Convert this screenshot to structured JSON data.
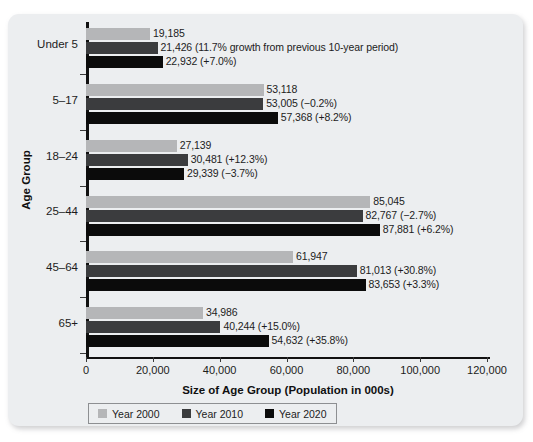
{
  "chart_data": {
    "type": "bar",
    "orientation": "horizontal",
    "title": "",
    "xlabel": "Size of Age Group (Population in 000s)",
    "ylabel": "Age Group",
    "xlim": [
      0,
      120000
    ],
    "xticks": [
      0,
      20000,
      40000,
      60000,
      80000,
      100000,
      120000
    ],
    "xtick_labels": [
      "0",
      "20,000",
      "40,000",
      "60,000",
      "80,000",
      "100,000",
      "120,000"
    ],
    "grid": false,
    "legend_position": "bottom",
    "categories": [
      "Under 5",
      "5–17",
      "18–24",
      "25–44",
      "45–64",
      "65+"
    ],
    "series": [
      {
        "name": "Year 2000",
        "color": "#b5b6b8",
        "values": [
          19185,
          53118,
          27139,
          85045,
          61947,
          34986
        ],
        "labels": [
          "19,185",
          "53,118",
          "27,139",
          "85,045",
          "61,947",
          "34,986"
        ]
      },
      {
        "name": "Year 2010",
        "color": "#3b3c3e",
        "values": [
          21426,
          53005,
          30481,
          82767,
          81013,
          40244
        ],
        "labels": [
          "21,426 (11.7% growth from previous 10-year period)",
          "53,005 (−0.2%)",
          "30,481 (+12.3%)",
          "82,767 (−2.7%)",
          "81,013 (+30.8%)",
          "40,244 (+15.0%)"
        ]
      },
      {
        "name": "Year 2020",
        "color": "#0b0b0b",
        "values": [
          22932,
          57368,
          29339,
          87881,
          83653,
          54632
        ],
        "labels": [
          "22,932 (+7.0%)",
          "57,368 (+8.2%)",
          "29,339 (−3.7%)",
          "87,881 (+6.2%)",
          "83,653 (+3.3%)",
          "54,632 (+35.8%)"
        ]
      }
    ]
  },
  "legend": {
    "items": [
      {
        "label": "Year 2000",
        "color": "#b5b6b8"
      },
      {
        "label": "Year 2010",
        "color": "#3b3c3e"
      },
      {
        "label": "Year 2020",
        "color": "#0b0b0b"
      }
    ]
  }
}
